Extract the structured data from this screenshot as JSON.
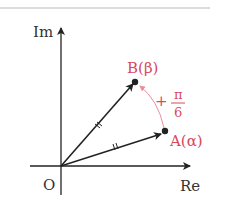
{
  "diagram": {
    "type": "complex-plane-rotation",
    "axes": {
      "x_label": "Re",
      "y_label": "Im",
      "origin_label": "O"
    },
    "points": [
      {
        "name": "A",
        "label": "A(α)",
        "color": "#d9485f"
      },
      {
        "name": "B",
        "label": "B(β)",
        "color": "#d9485f"
      }
    ],
    "rotation": {
      "sign": "+",
      "numerator": "π",
      "denominator": "6",
      "color": "#d9485f"
    },
    "vector_color": "#222222"
  }
}
